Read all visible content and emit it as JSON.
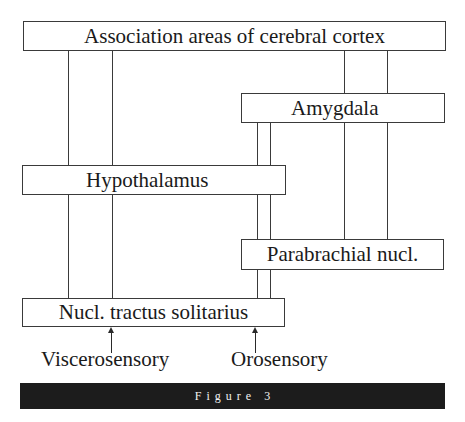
{
  "diagram": {
    "nodes": {
      "cortex": "Association areas of cerebral cortex",
      "amygdala": "Amygdala",
      "hypothalamus": "Hypothalamus",
      "parabrachial": "Parabrachial nucl.",
      "nts": "Nucl. tractus solitarius"
    },
    "inputs": {
      "viscerosensory": "Viscerosensory",
      "orosensory": "Orosensory"
    },
    "connections": [
      {
        "from": "cortex",
        "to": "hypothalamus",
        "count": 2
      },
      {
        "from": "hypothalamus",
        "to": "nts",
        "count": 2
      },
      {
        "from": "cortex",
        "to": "amygdala",
        "count": 2
      },
      {
        "from": "amygdala",
        "to": "parabrachial",
        "count": 2
      },
      {
        "from": "amygdala",
        "to": "hypothalamus",
        "count": 2
      },
      {
        "from": "hypothalamus",
        "to": "parabrachial",
        "count": 2
      },
      {
        "from": "parabrachial",
        "to": "nts",
        "count": 2
      },
      {
        "from": "viscerosensory",
        "to": "nts",
        "arrow": true
      },
      {
        "from": "orosensory",
        "to": "nts",
        "arrow": true
      }
    ],
    "colors": {
      "line": "#3a3a3a",
      "box_fill": "#ffffff",
      "caption_bar": "#1c1c1c",
      "caption_text": "#f2f2f2"
    }
  },
  "caption": {
    "label": "Figure 3"
  }
}
